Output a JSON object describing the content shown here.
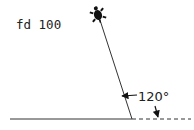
{
  "diagram": {
    "command_label": "fd 100",
    "angle_label": "120°",
    "colors": {
      "line": "#333333",
      "text": "#222222",
      "turtle": "#111111",
      "background": "#ffffff"
    },
    "elements": {
      "turtle_icon": "turtle-icon",
      "path_line": "forward 100 from base",
      "base_line": "solid horizontal baseline",
      "extension_line": "dashed extension of baseline",
      "angle_arrows": [
        "arrow to path line",
        "arrow to dashed extension"
      ]
    }
  }
}
